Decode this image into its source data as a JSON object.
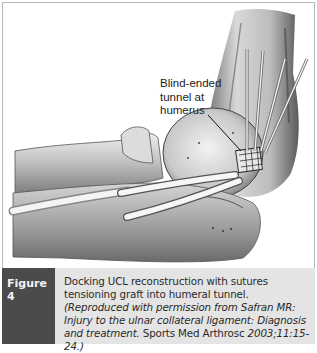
{
  "figure": {
    "callout": {
      "lines": [
        "Blind-ended",
        "tunnel at",
        "humerus"
      ]
    },
    "caption": {
      "label": "Figure 4",
      "text_plain_1": "Docking UCL reconstruction with sutures tensioning graft into humeral tunnel. ",
      "text_italic_1": "(Reproduced with permission from Safran MR: Injury to the ulnar collateral ligament: Diagnosis and treatment.",
      "text_plain_2": " Sports Med Arthrosc ",
      "text_italic_2": "2003;11:15-24.)"
    },
    "colors": {
      "label_bg": "#4b4b4b",
      "text_bg": "#e4e4e4",
      "border": "#b8b8b8"
    }
  }
}
